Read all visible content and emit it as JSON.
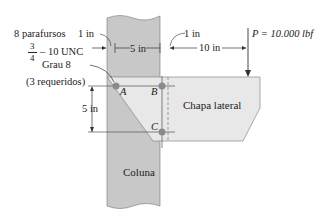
{
  "figure": {
    "bolts": {
      "line1": "8 parafursos",
      "frac_num": "3",
      "frac_den": "4",
      "line2": "– 10 UNC",
      "line3": "Grau 8",
      "line4": "(3 requeridos)"
    },
    "dims": {
      "left_gap": "1 in",
      "bolt_spacing": "5 in",
      "right_gap": "1 in",
      "load_offset": "10 in",
      "vertical": "5 in"
    },
    "load": "P = 10.000 lbf",
    "points": {
      "a": "A",
      "b": "B",
      "c": "C"
    },
    "plate_label": "Chapa lateral",
    "column_label": "Coluna"
  },
  "colors": {
    "column": "#c8c8c8",
    "plate": "#e6e6e6",
    "line": "#555555",
    "bolt": "#8a8a8a"
  }
}
